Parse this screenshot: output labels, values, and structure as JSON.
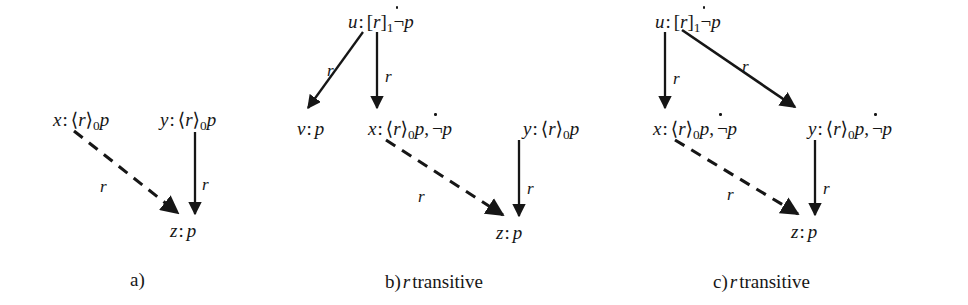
{
  "figure": {
    "background_color": "#ffffff",
    "ink_color": "#161616",
    "panels": [
      {
        "id": "a",
        "caption": "a)",
        "caption_suffix": "",
        "nodes": [
          {
            "id": "x",
            "label": "x: ⟨r⟩0p"
          },
          {
            "id": "y",
            "label": "y: ⟨r⟩0p"
          },
          {
            "id": "z",
            "label": "z: p"
          }
        ],
        "edges": [
          {
            "from": "x",
            "to": "z",
            "label": "r",
            "style": "dashed"
          },
          {
            "from": "y",
            "to": "z",
            "label": "r",
            "style": "solid"
          }
        ]
      },
      {
        "id": "b",
        "caption": "b)",
        "caption_suffix": "transitive",
        "caption_relation": "r",
        "nodes": [
          {
            "id": "u",
            "label": "u: [r]1 ¬̇p"
          },
          {
            "id": "v",
            "label": "v: p"
          },
          {
            "id": "x",
            "label": "x: ⟨r⟩0p, ¬̇p"
          },
          {
            "id": "y",
            "label": "y: ⟨r⟩0p"
          },
          {
            "id": "z",
            "label": "z: p"
          }
        ],
        "edges": [
          {
            "from": "u",
            "to": "v",
            "label": "r",
            "style": "solid"
          },
          {
            "from": "u",
            "to": "x",
            "label": "r",
            "style": "solid"
          },
          {
            "from": "x",
            "to": "z",
            "label": "r",
            "style": "dashed"
          },
          {
            "from": "y",
            "to": "z",
            "label": "r",
            "style": "solid"
          }
        ]
      },
      {
        "id": "c",
        "caption": "c)",
        "caption_suffix": "transitive",
        "caption_relation": "r",
        "nodes": [
          {
            "id": "u",
            "label": "u: [r]1 ¬̇p"
          },
          {
            "id": "x",
            "label": "x: ⟨r⟩0p, ¬̇p"
          },
          {
            "id": "y",
            "label": "y: ⟨r⟩0p, ¬̇p"
          },
          {
            "id": "z",
            "label": "z: p"
          }
        ],
        "edges": [
          {
            "from": "u",
            "to": "x",
            "label": "r",
            "style": "solid"
          },
          {
            "from": "u",
            "to": "y",
            "label": "r",
            "style": "solid"
          },
          {
            "from": "x",
            "to": "z",
            "label": "r",
            "style": "dashed"
          },
          {
            "from": "y",
            "to": "z",
            "label": "r",
            "style": "solid"
          }
        ]
      }
    ],
    "symbols": {
      "diamond_open": "⟨",
      "diamond_close": "⟩",
      "box_open": "[",
      "box_close": "]",
      "negation": "¬",
      "subscript_zero": "0",
      "subscript_one": "1",
      "proposition": "p",
      "relation": "r",
      "colon": ":",
      "comma": ","
    },
    "edge_labels": {
      "a_dashed": "r",
      "a_solid": "r",
      "b_u_v": "r",
      "b_u_x": "r",
      "b_dashed": "r",
      "b_y_z": "r",
      "c_u_x": "r",
      "c_u_y": "r",
      "c_dashed": "r",
      "c_y_z": "r"
    },
    "captions": {
      "a": "a)",
      "b_prefix": "b)",
      "b_rel": "r",
      "b_text": "transitive",
      "c_prefix": "c)",
      "c_rel": "r",
      "c_text": "transitive"
    },
    "node_text": {
      "a_x_var": "x",
      "a_x_colon": ":",
      "a_x_sub": "0",
      "a_x_prop": "p",
      "a_y_var": "y",
      "a_y_colon": ":",
      "a_y_sub": "0",
      "a_y_prop": "p",
      "a_z_var": "z",
      "a_z_colon": ":",
      "a_z_prop": "p",
      "b_u_var": "u",
      "b_u_colon": ":",
      "b_u_sub": "1",
      "b_u_prop": "p",
      "b_v_var": "v",
      "b_v_colon": ":",
      "b_v_prop": "p",
      "b_x_var": "x",
      "b_x_colon": ":",
      "b_x_sub": "0",
      "b_x_prop1": "p",
      "b_x_comma": ",",
      "b_x_prop2": "p",
      "b_y_var": "y",
      "b_y_colon": ":",
      "b_y_sub": "0",
      "b_y_prop": "p",
      "b_z_var": "z",
      "b_z_colon": ":",
      "b_z_prop": "p",
      "c_u_var": "u",
      "c_u_colon": ":",
      "c_u_sub": "1",
      "c_u_prop": "p",
      "c_x_var": "x",
      "c_x_colon": ":",
      "c_x_sub": "0",
      "c_x_prop1": "p",
      "c_x_comma": ",",
      "c_x_prop2": "p",
      "c_y_var": "y",
      "c_y_colon": ":",
      "c_y_sub": "0",
      "c_y_prop1": "p",
      "c_y_comma": ",",
      "c_y_prop2": "p",
      "c_z_var": "z",
      "c_z_colon": ":",
      "c_z_prop": "p"
    },
    "relation_glyphs": {
      "r1": "r",
      "r2": "r",
      "r3": "r",
      "r4": "r",
      "r5": "r",
      "r6": "r",
      "r7": "r",
      "r8": "r"
    }
  }
}
